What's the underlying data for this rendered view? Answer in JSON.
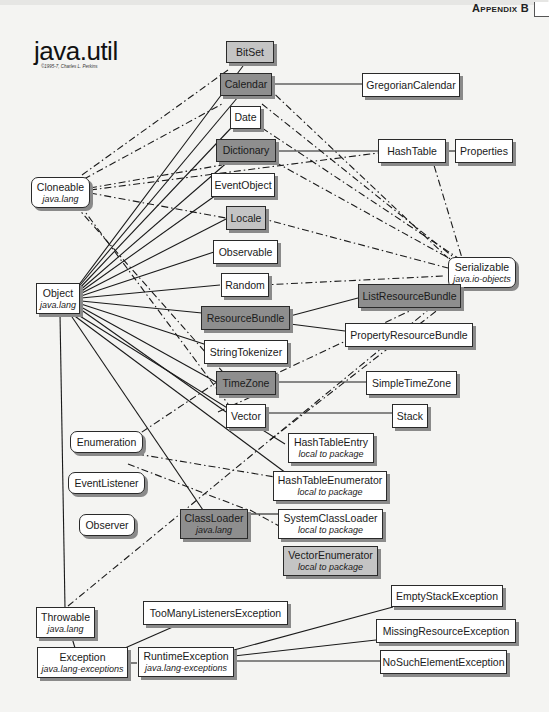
{
  "header": {
    "appendix_label": "Appendix B",
    "title": "java.util",
    "copyright": "©1995-7, Charles L. Perkins"
  },
  "colors": {
    "background": "#f4f4f2",
    "class_box": "#ffffff",
    "abstract_box": "#8e8e8e",
    "final_box": "#c4c4c4",
    "line": "#1a1a1a",
    "shadow": "#8a8a8a"
  },
  "legend_note": "Solid lines = inheritance; dash-dot lines = implements interface",
  "nodes": {
    "bitset": {
      "label": "BitSet"
    },
    "calendar": {
      "label": "Calendar"
    },
    "gregoriancalendar": {
      "label": "GregorianCalendar"
    },
    "date": {
      "label": "Date"
    },
    "dictionary": {
      "label": "Dictionary"
    },
    "hashtable": {
      "label": "HashTable"
    },
    "properties": {
      "label": "Properties"
    },
    "cloneable": {
      "label": "Cloneable",
      "sub": "java.lang"
    },
    "eventobject": {
      "label": "EventObject"
    },
    "locale": {
      "label": "Locale"
    },
    "serializable": {
      "label": "Serializable",
      "sub": "java.io-objects"
    },
    "observable": {
      "label": "Observable"
    },
    "object": {
      "label": "Object",
      "sub": "java.lang"
    },
    "random": {
      "label": "Random"
    },
    "resourcebundle": {
      "label": "ResourceBundle"
    },
    "listresourcebundle": {
      "label": "ListResourceBundle"
    },
    "propertyresourcebundle": {
      "label": "PropertyResourceBundle"
    },
    "stringtokenizer": {
      "label": "StringTokenizer"
    },
    "timezone": {
      "label": "TimeZone"
    },
    "simpletimezone": {
      "label": "SimpleTimeZone"
    },
    "vector": {
      "label": "Vector"
    },
    "stack": {
      "label": "Stack"
    },
    "hashtableentry": {
      "label": "HashTableEntry",
      "sub": "local to package"
    },
    "enumeration": {
      "label": "Enumeration"
    },
    "hashtableenumerator": {
      "label": "HashTableEnumerator",
      "sub": "local to package"
    },
    "eventlistener": {
      "label": "EventListener"
    },
    "classloader": {
      "label": "ClassLoader",
      "sub": "java.lang"
    },
    "systemclassloader": {
      "label": "SystemClassLoader",
      "sub": "local to package"
    },
    "observer": {
      "label": "Observer"
    },
    "vectorenumerator": {
      "label": "VectorEnumerator",
      "sub": "local to package"
    },
    "throwable": {
      "label": "Throwable",
      "sub": "java.lang"
    },
    "toomanylistenersexception": {
      "label": "TooManyListenersException"
    },
    "emptystackexception": {
      "label": "EmptyStackException"
    },
    "exception": {
      "label": "Exception",
      "sub": "java.lang-exceptions"
    },
    "runtimeexception": {
      "label": "RuntimeException",
      "sub": "java.lang-exceptions"
    },
    "missingresourceexception": {
      "label": "MissingResourceException"
    },
    "nosuchelementexception": {
      "label": "NoSuchElementException"
    }
  }
}
